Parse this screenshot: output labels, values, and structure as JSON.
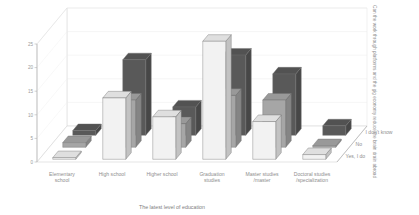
{
  "chart_data": {
    "type": "bar",
    "title": "",
    "subtitle": "",
    "xlabel": "The latest level of education",
    "ylabel": "",
    "zlabel": "Can the work through platforms and the gig economy reduce the brain drain abroad",
    "ylim": [
      0,
      25
    ],
    "yticks": [
      "0",
      "5",
      "10",
      "15",
      "20",
      "25"
    ],
    "ytick_values": [
      0,
      5,
      10,
      15,
      20,
      25
    ],
    "grid": true,
    "legend_position": "right-depth-axis",
    "categories": [
      "Elementary school",
      "High school",
      "Higher school",
      "Graduation studies",
      "Master studies /master",
      "Doctoral studies /specialization"
    ],
    "category_lines": [
      [
        "Elementary",
        "school"
      ],
      [
        "High school"
      ],
      [
        "Higher school"
      ],
      [
        "Graduation",
        "studies"
      ],
      [
        "Master studies",
        "/master"
      ],
      [
        "Doctoral studies",
        "/specialization"
      ]
    ],
    "depth_categories": [
      "Yes, I do",
      "No",
      "I don't know"
    ],
    "series": [
      {
        "name": "Yes, I do",
        "color": "#f2f2f2",
        "values": [
          0,
          13,
          9,
          25,
          8,
          1
        ]
      },
      {
        "name": "No",
        "color": "#a6a6a6",
        "values": [
          1,
          10,
          5,
          11,
          10,
          0
        ]
      },
      {
        "name": "I don't know",
        "color": "#595959",
        "values": [
          1,
          16,
          6,
          17,
          13,
          2
        ]
      }
    ]
  }
}
